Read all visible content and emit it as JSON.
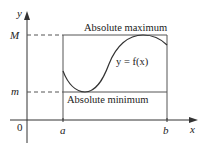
{
  "figure": {
    "type": "extreme-value-diagram",
    "axes": {
      "x_label": "x",
      "y_label": "y",
      "origin_label": "0"
    },
    "interval": {
      "left_label": "a",
      "right_label": "b"
    },
    "levels": {
      "max_label": "M",
      "min_label": "m"
    },
    "annotations": {
      "max_text": "Absolute maximum",
      "min_text": "Absolute minimum",
      "curve_text": "y = f(x)"
    },
    "colors": {
      "axis": "#333333",
      "lines": "#555555",
      "curve": "#333333",
      "text": "#222222",
      "background": "#ffffff"
    }
  }
}
